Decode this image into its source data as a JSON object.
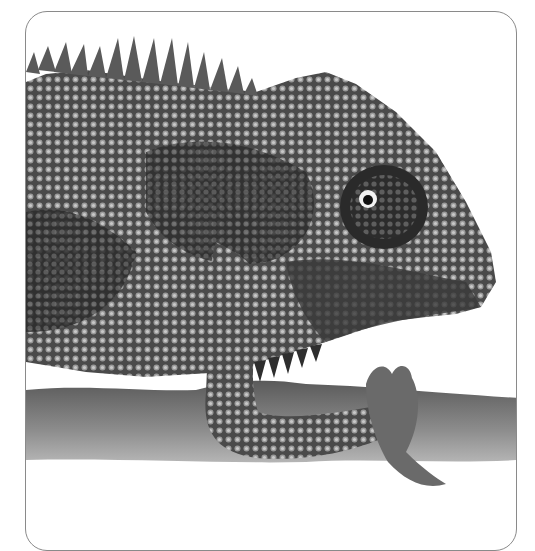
{
  "image": {
    "subject": "chameleon-on-branch",
    "style": "grayscale engraving illustration",
    "frame": {
      "shape": "rounded-rectangle",
      "border_color": "#8a8a8a",
      "background": "#ffffff"
    },
    "colors": {
      "skin_dark": "#2e2e2e",
      "skin_mid": "#6a6a6a",
      "skin_light": "#bdbdbd",
      "branch": "#7a7a7a",
      "eye_highlight": "#f2f2f2"
    }
  }
}
